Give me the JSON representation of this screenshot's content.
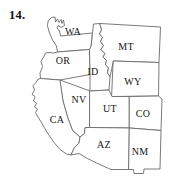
{
  "figure": {
    "question_number": "14.",
    "caption": "",
    "title": "",
    "kind": "map",
    "region": "Western United States"
  },
  "style": {
    "background_color": "#ffffff",
    "outline_color": "#6b6b6b",
    "fill_color": "#ffffff",
    "label_color": "#141414",
    "number_color": "#111111"
  },
  "map": {
    "states": [
      {
        "abbr": "WA",
        "label_x": 73,
        "label_y": 33,
        "path": "M 48.5 20.5 L 51.5 17.5 L 55.0 17.0 L 55.5 22.0 L 57.5 19.0 L 59.0 22.5 L 61.0 19.5 L 62.0 23.5 L 63.5 20.0 L 64.5 25.5 L 61.0 27.5 L 58.0 25.5 L 57.0 28.0 L 59.5 31.0 L 60.5 36.0 L 92.5 33.0 L 91.0 46.5 L 89.5 49.5 L 57.5 52.0 L 56.5 46.0 L 52.5 40.0 L 49.5 33.0 L 47.5 26.0 Z"
      },
      {
        "abbr": "OR",
        "label_x": 63,
        "label_y": 62,
        "path": "M 57.5 52.0 L 89.5 49.5 L 90.0 74.5 L 60.0 80.0 L 40.5 78.5 L 40.0 73.0 L 42.5 66.5 L 41.0 61.5 L 43.5 57.0 L 45.5 53.0 L 49.0 52.5 L 53.0 53.0 Z"
      },
      {
        "abbr": "ID",
        "label_x": 93,
        "label_y": 73,
        "path": "M 92.5 33.0 L 93.5 24.0 L 100.0 23.5 L 101.5 30.0 L 99.5 34.0 L 102.5 37.5 L 100.5 41.5 L 103.5 45.5 L 101.0 49.5 L 105.0 53.5 L 103.0 57.0 L 106.5 60.5 L 105.5 64.5 L 108.5 68.0 L 107.5 73.0 L 110.0 76.5 L 109.0 90.0 L 90.0 91.0 L 90.0 74.5 L 89.5 49.5 L 91.0 46.5 Z"
      },
      {
        "abbr": "MT",
        "label_x": 126,
        "label_y": 48,
        "path": "M 100.0 23.5 L 160.5 27.0 L 159.0 62.5 L 113.5 61.0 L 110.0 76.5 L 107.5 73.0 L 108.5 68.0 L 105.5 64.5 L 106.5 60.5 L 103.0 57.0 L 105.0 53.5 L 101.0 49.5 L 103.5 45.5 L 100.5 41.5 L 102.5 37.5 L 99.5 34.0 L 101.5 30.0 Z"
      },
      {
        "abbr": "WY",
        "label_x": 133,
        "label_y": 83,
        "path": "M 113.5 61.0 L 159.0 62.5 L 158.5 96.0 L 112.0 96.5 Z"
      },
      {
        "abbr": "NV",
        "label_x": 79,
        "label_y": 101,
        "path": "M 60.0 80.0 L 90.0 91.0 L 90.0 127.5 L 85.0 128.0 L 84.5 133.5 L 80.0 137.0 L 72.5 130.5 L 67.5 117.0 L 63.0 101.0 Z"
      },
      {
        "abbr": "UT",
        "label_x": 110,
        "label_y": 110,
        "path": "M 90.0 91.0 L 109.0 90.0 L 112.0 96.5 L 129.5 96.5 L 129.5 128.0 L 90.0 127.5 Z"
      },
      {
        "abbr": "CO",
        "label_x": 143,
        "label_y": 115,
        "path": "M 129.5 96.5 L 158.5 96.0 L 162.0 99.0 L 161.0 130.5 L 129.5 128.0 Z"
      },
      {
        "abbr": "CA",
        "label_x": 57,
        "label_y": 121,
        "path": "M 40.5 78.5 L 60.0 80.0 L 63.0 101.0 L 67.5 117.0 L 72.5 130.5 L 80.0 137.0 L 79.0 143.0 L 74.5 147.5 L 71.0 155.0 L 66.5 154.0 L 60.0 149.5 L 54.0 142.5 L 47.5 133.0 L 42.0 123.5 L 38.0 117.0 L 35.5 112.5 L 37.5 109.0 L 34.5 107.0 L 36.5 103.0 L 33.5 101.0 L 35.0 96.5 L 32.0 94.5 L 34.5 90.0 L 33.0 85.5 L 36.0 82.5 L 37.5 80.0 Z"
      },
      {
        "abbr": "AZ",
        "label_x": 104,
        "label_y": 146,
        "path": "M 90.0 127.5 L 129.5 128.0 L 129.0 169.5 L 111.0 169.5 L 96.5 163.0 L 87.5 158.5 L 79.0 153.5 L 71.0 155.0 L 74.5 147.5 L 79.0 143.0 L 80.0 137.0 L 84.5 133.5 L 85.0 128.0 Z"
      },
      {
        "abbr": "NM",
        "label_x": 140,
        "label_y": 153,
        "path": "M 129.5 128.0 L 161.0 130.5 L 160.0 169.0 L 144.0 169.0 L 143.5 173.5 L 134.0 173.5 L 133.5 169.5 L 129.0 169.5 Z"
      }
    ]
  }
}
